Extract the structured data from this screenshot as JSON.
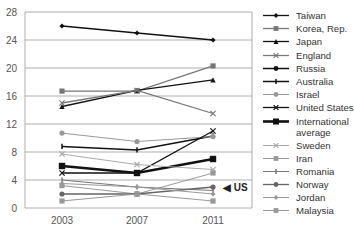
{
  "chart_data": {
    "type": "line",
    "title": "",
    "xlabel": "",
    "ylabel": "",
    "x": [
      "2003",
      "2007",
      "2011"
    ],
    "ylim": [
      0,
      28
    ],
    "yticks": [
      0,
      4,
      8,
      12,
      16,
      20,
      24,
      28
    ],
    "grid": true,
    "legend_position": "right",
    "annotation": "US",
    "series": [
      {
        "name": "Taiwan",
        "values": [
          26,
          25,
          24
        ],
        "color": "#111111",
        "marker": "diamond",
        "width": 1.3
      },
      {
        "name": "Korea, Rep.",
        "values": [
          16.7,
          16.7,
          20.3
        ],
        "color": "#777777",
        "marker": "square",
        "width": 1.3
      },
      {
        "name": "Japan",
        "values": [
          14.5,
          16.8,
          18.3
        ],
        "color": "#111111",
        "marker": "triangle",
        "width": 1.3
      },
      {
        "name": "England",
        "values": [
          15,
          16.8,
          13.5
        ],
        "color": "#777777",
        "marker": "x",
        "width": 1.3
      },
      {
        "name": "Russia",
        "values": [
          null,
          null,
          null
        ],
        "color": "#111111",
        "marker": "circle",
        "width": 1.5
      },
      {
        "name": "Australia",
        "values": [
          8.8,
          8.3,
          10.3
        ],
        "color": "#111111",
        "marker": "bar",
        "width": 1.5
      },
      {
        "name": "Israel",
        "values": [
          10.7,
          9.5,
          10.2
        ],
        "color": "#999999",
        "marker": "circle",
        "width": 1
      },
      {
        "name": "United States",
        "values": [
          5,
          5,
          11
        ],
        "color": "#111111",
        "marker": "x",
        "width": 1.3
      },
      {
        "name": "International average",
        "values": [
          6,
          5,
          7
        ],
        "color": "#111111",
        "marker": "square",
        "width": 2.6
      },
      {
        "name": "Sweden",
        "values": [
          7.7,
          6.2,
          5.5
        ],
        "color": "#aaaaaa",
        "marker": "x",
        "width": 1
      },
      {
        "name": "Iran",
        "values": [
          3.2,
          2,
          5
        ],
        "color": "#999999",
        "marker": "square",
        "width": 1
      },
      {
        "name": "Romania",
        "values": [
          4,
          3,
          2.5
        ],
        "color": "#777777",
        "marker": "bar",
        "width": 1
      },
      {
        "name": "Norway",
        "values": [
          2,
          2,
          3
        ],
        "color": "#666666",
        "marker": "circle",
        "width": 1.3
      },
      {
        "name": "Jordan",
        "values": [
          3.5,
          3,
          2
        ],
        "color": "#999999",
        "marker": "diamond",
        "width": 1
      },
      {
        "name": "Malaysia",
        "values": [
          1,
          2,
          1
        ],
        "color": "#999999",
        "marker": "square",
        "width": 1
      }
    ]
  },
  "legend": {
    "items": [
      "Taiwan",
      "Korea, Rep.",
      "Japan",
      "England",
      "Russia",
      "Australia",
      "Israel",
      "United States",
      "International average",
      "Sweden",
      "Iran",
      "Romania",
      "Norway",
      "Jordan",
      "Malaysia"
    ]
  },
  "annotation": {
    "us_label": "◀ US"
  }
}
